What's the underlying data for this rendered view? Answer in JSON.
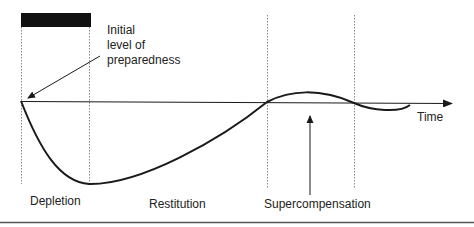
{
  "diagram": {
    "title_bar": "load-period-bar",
    "annotation": {
      "lines": [
        "Initial",
        "level of",
        "preparedness"
      ]
    },
    "axis_label": "Time",
    "phases": [
      {
        "label": "Depletion"
      },
      {
        "label": "Restitution"
      },
      {
        "label": "Supercompensation"
      }
    ],
    "colors": {
      "ink": "#1a1a1a",
      "bar": "#111111",
      "guide": "#888888"
    }
  }
}
